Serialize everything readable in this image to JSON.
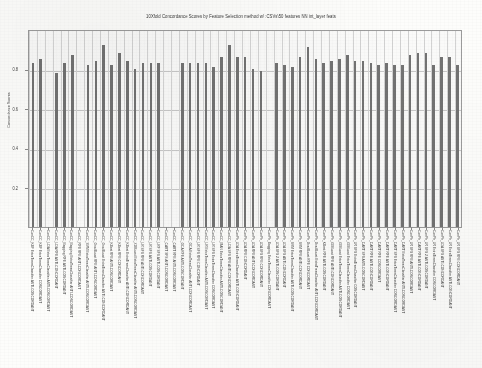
{
  "figure": {
    "type": "scanned-chart-image",
    "background_color": "#fdfdfb",
    "bar_color": "#6e6e6e",
    "frame_color": "#9a9a9a",
    "grid_color": "#c9c9c9"
  },
  "chart_data": {
    "type": "bar",
    "title": "10Xfold Concordance Scores by Feature Selection method w/ :CSVs\\50 features NN int_layer feats",
    "xlabel": "",
    "ylabel": "Concordance Scores",
    "ylim": [
      0,
      1
    ],
    "yticks": [
      0.2,
      0.4,
      0.6,
      0.8
    ],
    "ytick_labels": [
      "0.2",
      "0.4",
      "0.6",
      "0.8"
    ],
    "grid": true,
    "legend": "none",
    "categories": [
      "ConCC_KBF ExtraTreesClassifier ANTI-CONCORDANT",
      "ConCC_KBF ExtraTreesClassifier CONCORDANT",
      "ConCC_LDA ExtraTreesClassifier ANTI-CONCORDANT",
      "ConCC_LDA RFE ANTI-CONCORDANT",
      "ConCC_Bagging RFE ANTI-CONCORDANT",
      "ConCC_Bagging ExtraTreesClassifier ANTI-CONCORDANT",
      "ConCC_RFE RFE ANTI-CONCORDANT",
      "ConCC_SVM ExtraTreesClassifier ANTI-CONCORDANT",
      "ConCC_GradBoost RFE ANTI-CONCORDANT",
      "ConCC_GradBoost ExtraTreesClassifier ANTI-CONCORDANT",
      "ConCC_KBest RFE ANTI-CONCORDANT",
      "ConCC_KBest RFE CONCORDANT",
      "ConCC_KBest ExtraTreesClassifier ANTI-CONCORDANT",
      "ConCC_XGBoost ExtraTreesClassifier ANTI-CONCORDANT",
      "ConCC_LR SFS RFE ANTI-CONCORDANT",
      "ConCC_LR SFS ANTI-CONCORDANT",
      "ConCC_LRF SFS ANTI-CONCORDANT",
      "ConCC_CART SFS ANTI-CONCORDANT",
      "ConCC_CART RFE ANTI-CONCORDANT",
      "ConCC_GCA RFE ANTI-CONCORDANT",
      "ConCC_GCA ExtraTreesClassifier ANTI-CONCORDANT",
      "ConCC_LR SFS RFE CONCORDANT",
      "ConCC_LR ExtraTreesClassifier ANTI-CONCORDANT",
      "ConCC_LR SFS ExtraTreesClassifier CONCORDANT",
      "ConCC_MAN ExtraTreesClassifier ANTI-CONCORDANT",
      "ConCC_LDA SFS RFE ANTI-CONCORDANT",
      "ConPh_LDA ExtraTreesClassifier ANTI-CONCORDANT",
      "ConPh_LDA RFE CONCORDANT",
      "ConPh_LDA RFE ANTI-CONCORDANT",
      "ConPh_LDA SFS RFE CONCORDANT",
      "ConPh_Bagging ExtraTreesClassifier CONCORDANT",
      "ConPh_LDA SFS 2 ANTI-CONCORDANT",
      "ConPh_LDA SFS ANTI-CONCORDANT",
      "ConPh_SVM ExtraTreesClassifier ANTI-CONCORDANT",
      "ConPh_SVM RFE ANTI-CONCORDANT",
      "ConPh_GradBoost RFE CONCORDANT",
      "ConPh_GradBoost ExtraTreesClassifier ANTI-CONCORDANT",
      "ConPh_KBest RFE ANTI-CONCORDANT",
      "ConPh_XGBoost RFE ANTI-CONCORDANT",
      "ConPh_XGBoost ExtraTreesClassifier ANTI-CONCORDANT",
      "ConPh_XGBoost ExtraTreesClassifier CONCORDANT",
      "ConPh_LR SFS ExtraTreesClassifier CONCORDANT",
      "ConPh_CART SFS ANTI-CONCORDANT",
      "ConPh_CART RFE ANTI-CONCORDANT",
      "ConPh_CART RFE CONCORDANT",
      "ConPh_CART RFE ANTI-CONCORDANT",
      "ConPh_CART SFS ExtraTreesClassifier CONCORDANT",
      "ConPh_CART ExtraTreesClassifier ANTI-CONCORDANT",
      "ConPh_LR SFS RFE ANTI-CONCORDANT",
      "ConPh_CART RFE ANTI-CONCORDANT",
      "ConPh_LR SFS 2 ANTI-CONCORDANT",
      "ConPh_LR ExtraTreesClassifier CONCORDANT",
      "ConPh_LDA SFS ANTI-CONCORDANT",
      "ConPh_LR ExtraTreesClassifier ANTI-CONCORDANT",
      "ConPh_LR SFS RFE CONCORDANT"
    ],
    "values": [
      0.83,
      0.85,
      0.0,
      0.78,
      0.83,
      0.87,
      0.0,
      0.82,
      0.84,
      0.92,
      0.82,
      0.88,
      0.84,
      0.8,
      0.83,
      0.83,
      0.83,
      0.0,
      0.0,
      0.83,
      0.83,
      0.83,
      0.83,
      0.81,
      0.86,
      0.92,
      0.86,
      0.86,
      0.8,
      0.79,
      0.0,
      0.83,
      0.82,
      0.81,
      0.86,
      0.91,
      0.85,
      0.83,
      0.84,
      0.85,
      0.87,
      0.84,
      0.84,
      0.83,
      0.82,
      0.83,
      0.82,
      0.82,
      0.87,
      0.88,
      0.88,
      0.82,
      0.86,
      0.86,
      0.82
    ]
  }
}
